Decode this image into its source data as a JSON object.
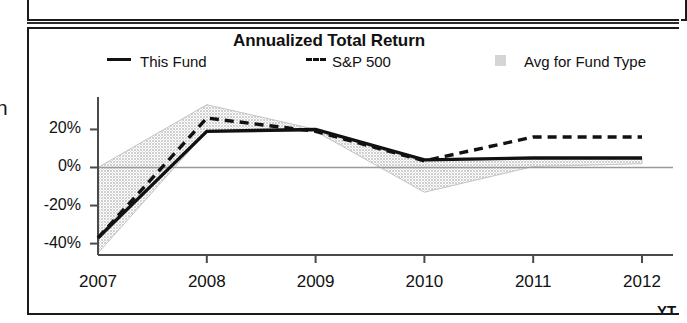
{
  "chart": {
    "title": "Annualized Total Return",
    "axis_suffix_label": "YT",
    "margin_glyph": "n",
    "legend": [
      {
        "label": "This Fund",
        "marker": "solid-line-swatch"
      },
      {
        "label": "S&P 500",
        "marker": "dashed-line-swatch"
      },
      {
        "label": "Avg for Fund Type",
        "marker": "gray-box-swatch"
      }
    ],
    "ytick_labels": [
      "20%",
      "0%",
      "-20%",
      "-40%"
    ],
    "xtick_labels": [
      "2007",
      "2008",
      "2009",
      "2010",
      "2011",
      "2012"
    ],
    "colors": {
      "line": "#111111",
      "band": "#d5d5d5",
      "axis": "#4a4a4a",
      "frame": "#1a1a1a"
    }
  },
  "chart_data": {
    "type": "line",
    "title": "Annualized Total Return",
    "xlabel": "",
    "ylabel": "",
    "x": [
      "2007",
      "2008",
      "2009",
      "2010",
      "2011",
      "2012"
    ],
    "categories": [
      "2007",
      "2008",
      "2009",
      "2010",
      "2011",
      "2012"
    ],
    "ylim": [
      -46,
      36
    ],
    "yticks": [
      20,
      0,
      -20,
      -40
    ],
    "ytick_labels": [
      "20%",
      "0%",
      "-20%",
      "-40%"
    ],
    "grid": false,
    "legend_position": "top",
    "series": [
      {
        "name": "This Fund",
        "style": "solid",
        "values": [
          -37,
          19,
          20,
          4,
          5,
          5
        ]
      },
      {
        "name": "S&P 500",
        "style": "dashed",
        "values": [
          -37,
          26,
          19,
          3.5,
          16,
          16
        ]
      },
      {
        "name": "Avg for Fund Type",
        "style": "shaded-band",
        "band_upper": [
          0,
          33,
          20,
          4,
          5,
          5
        ],
        "band_lower": [
          -45,
          19,
          19,
          -13,
          0.5,
          2
        ]
      }
    ]
  }
}
